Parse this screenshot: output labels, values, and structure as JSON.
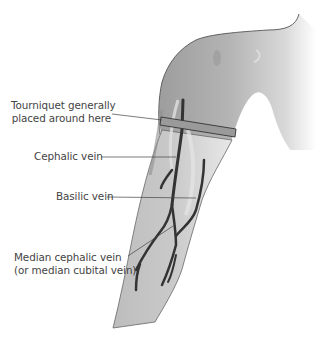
{
  "diagram": {
    "labels": {
      "tourniquet": {
        "line1": "Tourniquet generally",
        "line2": "placed around here"
      },
      "cephalic": "Cephalic vein",
      "basilic": "Basilic vein",
      "median": {
        "line1": "Median cephalic vein",
        "line2": "(or median cubital vein)"
      }
    },
    "colors": {
      "skin": "#a9a9a9",
      "skin_light": "#d3d3d3",
      "vein": "#333333",
      "tourniquet": "#9a9a9a",
      "outline": "#555555",
      "label_text": "#444444"
    }
  }
}
